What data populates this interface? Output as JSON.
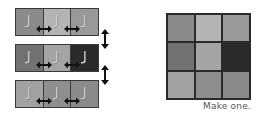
{
  "rows": [
    {
      "cells": [
        {
          "color": "#8a8a8a"
        },
        {
          "color": "#b4b4b4"
        },
        {
          "color": "#999999"
        }
      ]
    },
    {
      "cells": [
        {
          "color": "#727272"
        },
        {
          "color": "#a4a4a4"
        },
        {
          "color": "#2a2a2a"
        }
      ]
    },
    {
      "cells": [
        {
          "color": "#a2a2a2"
        },
        {
          "color": "#8e8e8e"
        },
        {
          "color": "#8a8a8a"
        }
      ]
    }
  ],
  "glyph": {
    "icon": "j-hook-glyph",
    "color": "#d8d8d8"
  },
  "arrows": {
    "horizontal": "double-headed-left-right",
    "vertical": "double-headed-up-down",
    "color": "#111111"
  },
  "grid": {
    "cells": [
      [
        "#8a8a8a",
        "#b4b4b4",
        "#999999"
      ],
      [
        "#727272",
        "#a4a4a4",
        "#2a2a2a"
      ],
      [
        "#a2a2a2",
        "#8e8e8e",
        "#8a8a8a"
      ]
    ]
  },
  "caption": "Make one."
}
